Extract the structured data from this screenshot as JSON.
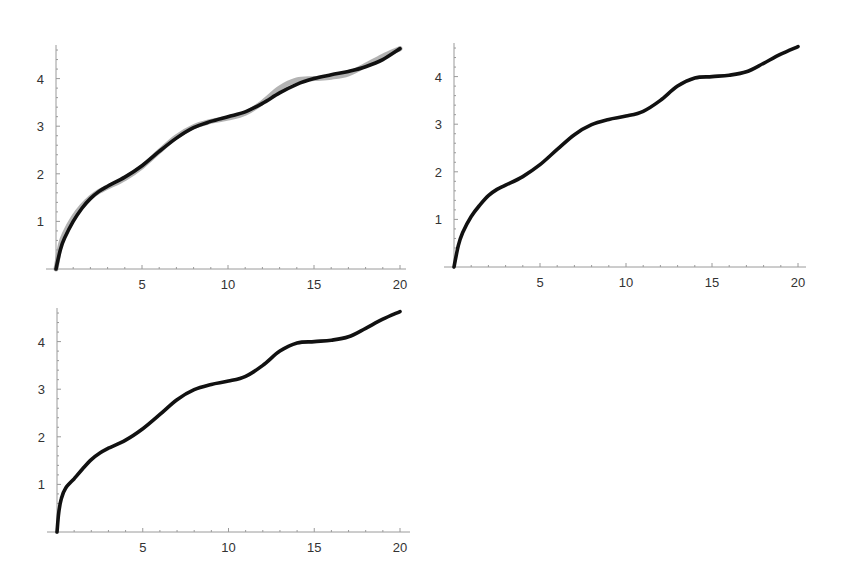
{
  "chart_data": [
    {
      "type": "line",
      "title": "",
      "xlabel": "",
      "ylabel": "",
      "xlim": [
        0,
        20
      ],
      "ylim": [
        0,
        4.7
      ],
      "grid": false,
      "legend": null,
      "x_ticks": [
        "5",
        "10",
        "15",
        "20"
      ],
      "y_ticks": [
        "1",
        "2",
        "3",
        "4"
      ],
      "series": [
        {
          "name": "approximation",
          "color": "#111111",
          "x": [
            0,
            0.25,
            0.5,
            1,
            1.5,
            2,
            2.5,
            3,
            4,
            5,
            6,
            7,
            8,
            9,
            10,
            11,
            12,
            13,
            14,
            15,
            16,
            17,
            18,
            19,
            20
          ],
          "values": [
            0,
            0.4,
            0.65,
            1.0,
            1.27,
            1.48,
            1.63,
            1.74,
            1.93,
            2.17,
            2.47,
            2.75,
            2.97,
            3.1,
            3.2,
            3.3,
            3.48,
            3.7,
            3.88,
            4.0,
            4.08,
            4.15,
            4.25,
            4.4,
            4.63
          ]
        },
        {
          "name": "exact",
          "color": "#9a9a9a",
          "x": [
            0,
            0.25,
            0.5,
            1,
            1.5,
            2,
            2.5,
            3,
            4,
            5,
            6,
            7,
            8,
            9,
            10,
            11,
            12,
            13,
            14,
            15,
            16,
            17,
            18,
            19,
            20
          ],
          "values": [
            0,
            0.5,
            0.75,
            1.08,
            1.32,
            1.5,
            1.63,
            1.72,
            1.9,
            2.15,
            2.47,
            2.78,
            2.99,
            3.1,
            3.17,
            3.27,
            3.5,
            3.8,
            3.97,
            4.0,
            4.03,
            4.1,
            4.28,
            4.47,
            4.63
          ]
        }
      ]
    },
    {
      "type": "line",
      "title": "",
      "xlabel": "",
      "ylabel": "",
      "xlim": [
        0,
        20
      ],
      "ylim": [
        0,
        4.7
      ],
      "grid": false,
      "legend": null,
      "x_ticks": [
        "5",
        "10",
        "15",
        "20"
      ],
      "y_ticks": [
        "1",
        "2",
        "3",
        "4"
      ],
      "series": [
        {
          "name": "curve",
          "color": "#111111",
          "x": [
            0,
            0.25,
            0.5,
            1,
            1.5,
            2,
            2.5,
            3,
            4,
            5,
            6,
            7,
            8,
            9,
            10,
            11,
            12,
            13,
            14,
            15,
            16,
            17,
            18,
            19,
            20
          ],
          "values": [
            0,
            0.45,
            0.72,
            1.06,
            1.3,
            1.5,
            1.63,
            1.72,
            1.9,
            2.15,
            2.47,
            2.78,
            2.99,
            3.1,
            3.17,
            3.27,
            3.5,
            3.8,
            3.97,
            4.0,
            4.03,
            4.1,
            4.28,
            4.47,
            4.63
          ]
        }
      ]
    },
    {
      "type": "line",
      "title": "",
      "xlabel": "",
      "ylabel": "",
      "xlim": [
        0,
        20
      ],
      "ylim": [
        0,
        4.7
      ],
      "grid": false,
      "legend": null,
      "x_ticks": [
        "5",
        "10",
        "15",
        "20"
      ],
      "y_ticks": [
        "1",
        "2",
        "3",
        "4"
      ],
      "series": [
        {
          "name": "curve",
          "color": "#111111",
          "x": [
            0,
            0.1,
            0.25,
            0.5,
            1,
            1.5,
            2,
            2.5,
            3,
            4,
            5,
            6,
            7,
            8,
            9,
            10,
            11,
            12,
            13,
            14,
            15,
            16,
            17,
            18,
            19,
            20
          ],
          "values": [
            0,
            0.4,
            0.7,
            0.92,
            1.12,
            1.33,
            1.52,
            1.66,
            1.76,
            1.93,
            2.17,
            2.47,
            2.78,
            2.99,
            3.1,
            3.17,
            3.27,
            3.5,
            3.8,
            3.97,
            4.0,
            4.03,
            4.1,
            4.28,
            4.47,
            4.63
          ]
        }
      ]
    }
  ],
  "panels": [
    {
      "x0": 56,
      "y0": 269,
      "sx": 17.2,
      "sy": 47.6,
      "ytop": 45,
      "xright": 406
    },
    {
      "x0": 454,
      "y0": 267,
      "sx": 17.2,
      "sy": 47.6,
      "ytop": 43,
      "xright": 806
    },
    {
      "x0": 57,
      "y0": 532,
      "sx": 17.15,
      "sy": 47.6,
      "ytop": 308,
      "xright": 410
    }
  ]
}
